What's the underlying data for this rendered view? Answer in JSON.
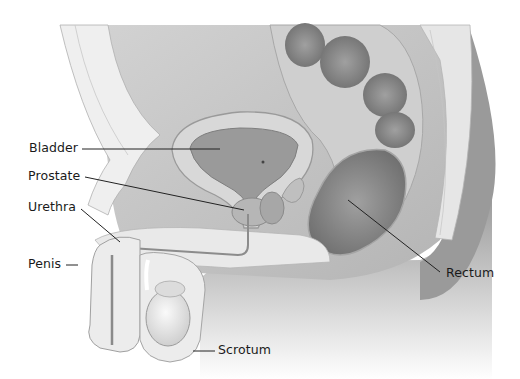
{
  "diagram": {
    "labels": {
      "bladder": "Bladder",
      "prostate": "Prostate",
      "urethra": "Urethra",
      "penis": "Penis",
      "scrotum": "Scrotum",
      "rectum": "Rectum"
    },
    "colors": {
      "background": "#ffffff",
      "tissue_light": "#ececec",
      "tissue_mid": "#bdbdbd",
      "tissue_dark": "#8e8e8e",
      "organ_dark": "#7d7d7d",
      "leader_line": "#222222",
      "text": "#1a1a1a"
    }
  }
}
